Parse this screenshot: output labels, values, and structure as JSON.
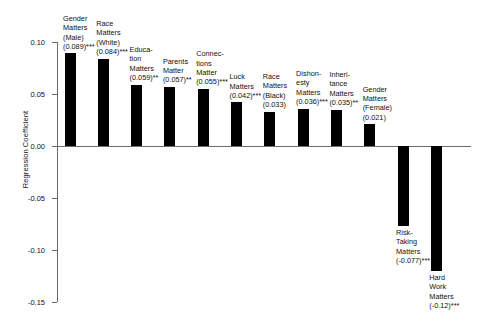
{
  "chart_data": {
    "type": "bar",
    "title": "",
    "xlabel": "",
    "ylabel": "Regression Coefficient",
    "ylim": [
      -0.15,
      0.1
    ],
    "yticks": [
      0.1,
      0.05,
      0.0,
      -0.05,
      -0.1,
      -0.15
    ],
    "ytick_labels": [
      "0.10",
      "0.05",
      "0.00",
      "-0.05",
      "-0.10",
      "-0.15"
    ],
    "grid": false,
    "legend": "none",
    "bar_color": "#000000",
    "axis_color": "#6c6c6c",
    "categories": [
      "Gender Matters (Male)",
      "Race Matters (White)",
      "Education Matters",
      "Parents Matter",
      "Connections Matter",
      "Luck Matters",
      "Race Matters (Black)",
      "Dishonesty Matters",
      "Inheritance Matters",
      "Gender Matters (Female)",
      "Risk-Taking Matters",
      "Hard Work Matters"
    ],
    "values": [
      0.089,
      0.084,
      0.059,
      0.057,
      0.055,
      0.042,
      0.033,
      0.036,
      0.035,
      0.021,
      -0.077,
      -0.12
    ],
    "bars": [
      {
        "name": "Gender\nMatters\n(Male)",
        "value": 0.089,
        "coef_label": "(0.089)***",
        "stars": "***"
      },
      {
        "name": "Race\nMatters\n(White)",
        "value": 0.084,
        "coef_label": "(0.084)***",
        "stars": "***"
      },
      {
        "name": "Educa-\ntion\nMatters",
        "value": 0.059,
        "coef_label": "(0.059)**",
        "stars": "**"
      },
      {
        "name": "Parents\nMatter",
        "value": 0.057,
        "coef_label": "(0.057)**",
        "stars": "**"
      },
      {
        "name": "Connec-\ntions\nMatter",
        "value": 0.055,
        "coef_label": "(0.055)***",
        "stars": "***"
      },
      {
        "name": "Luck\nMatters",
        "value": 0.042,
        "coef_label": "(0.042)***",
        "stars": "***"
      },
      {
        "name": "Race\nMatters\n(Black)",
        "value": 0.033,
        "coef_label": "(0.033)",
        "stars": ""
      },
      {
        "name": "Dishon-\nesty\nMatters",
        "value": 0.036,
        "coef_label": "(0.036)***",
        "stars": "***"
      },
      {
        "name": "Inheri-\ntance\nMatters",
        "value": 0.035,
        "coef_label": "(0.035)**",
        "stars": "**"
      },
      {
        "name": "Gender\nMatters\n(Female)",
        "value": 0.021,
        "coef_label": "(0.021)",
        "stars": ""
      },
      {
        "name": "Risk-\nTaking\nMatters",
        "value": -0.077,
        "coef_label": "(-0.077)***",
        "stars": "***"
      },
      {
        "name": "Hard\nWork\nMatters",
        "value": -0.12,
        "coef_label": "(-0.12)***",
        "stars": "***"
      }
    ]
  }
}
